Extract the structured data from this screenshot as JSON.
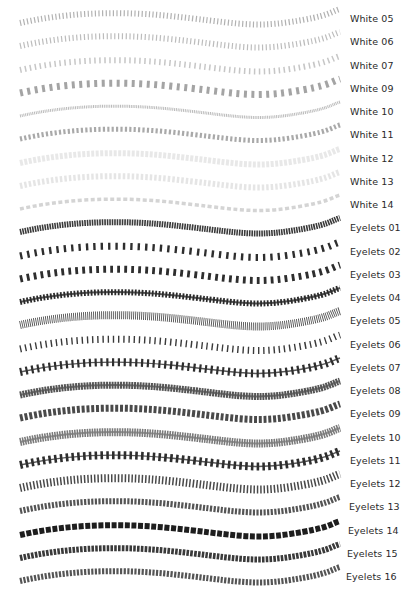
{
  "rows": [
    {
      "label": "White 05",
      "style": "zigzag",
      "color": "#a8a8a8",
      "width": 6,
      "dash": "1.2 2.4",
      "opacity": 0.9
    },
    {
      "label": "White 06",
      "style": "zigzag",
      "color": "#b0b0b0",
      "width": 6,
      "dash": "1.2 2.6",
      "opacity": 0.85
    },
    {
      "label": "White 07",
      "style": "y-stitch",
      "color": "#b8b8b8",
      "width": 6,
      "dash": "1.5 3.5",
      "opacity": 0.8
    },
    {
      "label": "White 09",
      "style": "hook",
      "color": "#9a9a9a",
      "width": 7,
      "dash": "3 4.5",
      "opacity": 0.9
    },
    {
      "label": "White 10",
      "style": "chain",
      "color": "#b4b4b4",
      "width": 3,
      "dash": "1 0.8",
      "opacity": 0.9
    },
    {
      "label": "White 11",
      "style": "twist",
      "color": "#a0a0a0",
      "width": 5,
      "dash": "2.2 2.2",
      "opacity": 0.9
    },
    {
      "label": "White 12",
      "style": "faint",
      "color": "#e6e6e6",
      "width": 6,
      "dash": "3 1.5",
      "opacity": 0.9
    },
    {
      "label": "White 13",
      "style": "faint",
      "color": "#e2e2e2",
      "width": 6,
      "dash": "2.5 2",
      "opacity": 0.9
    },
    {
      "label": "White 14",
      "style": "dash-loop",
      "color": "#cfcfcf",
      "width": 3.5,
      "dash": "4 2.5",
      "opacity": 0.9
    },
    {
      "label": "Eyelets 01",
      "style": "dense-block",
      "color": "#3a3a3a",
      "width": 6,
      "dash": "1.6 0.9",
      "opacity": 1
    },
    {
      "label": "Eyelets 02",
      "style": "spool",
      "color": "#2e2e2e",
      "width": 7,
      "dash": "2.4 5",
      "opacity": 1
    },
    {
      "label": "Eyelets 03",
      "style": "bone",
      "color": "#2e2e2e",
      "width": 7,
      "dash": "2.8 4.2",
      "opacity": 1
    },
    {
      "label": "Eyelets 04",
      "style": "dot-chain",
      "color": "#2a2a2a",
      "width": 6,
      "dash": "1.8 1.6",
      "opacity": 1
    },
    {
      "label": "Eyelets 05",
      "style": "ladder",
      "color": "#4a4a4a",
      "width": 8,
      "dash": "0.9 1.1",
      "opacity": 0.95
    },
    {
      "label": "Eyelets 06",
      "style": "zigzag-dots",
      "color": "#3a3a3a",
      "width": 7,
      "dash": "1.4 3.8",
      "opacity": 1
    },
    {
      "label": "Eyelets 07",
      "style": "pin-line",
      "color": "#2e2e2e",
      "width": 8,
      "dash": "2.2 3.6",
      "opacity": 1
    },
    {
      "label": "Eyelets 08",
      "style": "textured-band",
      "color": "#555555",
      "width": 7,
      "dash": "2 0.8",
      "opacity": 1
    },
    {
      "label": "Eyelets 09",
      "style": "cross",
      "color": "#4a4a4a",
      "width": 7,
      "dash": "3 1.8",
      "opacity": 1
    },
    {
      "label": "Eyelets 10",
      "style": "lace-band",
      "color": "#7a7a7a",
      "width": 8,
      "dash": "1.6 0.9",
      "opacity": 1
    },
    {
      "label": "Eyelets 11",
      "style": "bead-line",
      "color": "#2e2e2e",
      "width": 8,
      "dash": "2.6 3.2",
      "opacity": 1
    },
    {
      "label": "Eyelets 12",
      "style": "bars",
      "color": "#4a4a4a",
      "width": 8,
      "dash": "1.5 1.9",
      "opacity": 1
    },
    {
      "label": "Eyelets 13",
      "style": "grommet",
      "color": "#555555",
      "width": 6,
      "dash": "2.2 1.4",
      "opacity": 1
    },
    {
      "label": "Eyelets 14",
      "style": "solid-block",
      "color": "#1e1e1e",
      "width": 6,
      "dash": "5 1.6",
      "opacity": 1
    },
    {
      "label": "Eyelets 15",
      "style": "grommet-dark",
      "color": "#3a3a3a",
      "width": 6,
      "dash": "2.6 1.2",
      "opacity": 1
    },
    {
      "label": "Eyelets 16",
      "style": "grommet",
      "color": "#555555",
      "width": 6,
      "dash": "2.2 1.4",
      "opacity": 1
    }
  ]
}
